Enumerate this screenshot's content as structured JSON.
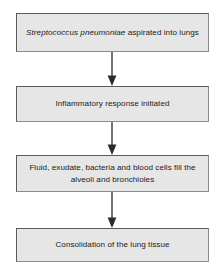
{
  "diagram": {
    "background_color": "#ffffff",
    "box_fill_color": "#e6e6e6",
    "box_border_color": "#5a5a5a",
    "arrow_color": "#2b2b2b",
    "orientation": "vertical top-to-bottom",
    "nodes": [
      {
        "id": "node-1",
        "organism_italic": "Streptococcus pneumoniae",
        "text_rest": " aspirated into lungs",
        "full_text": "Streptococcus pneumoniae aspirated into lungs"
      },
      {
        "id": "node-2",
        "full_text": "Inflammatory response initiated"
      },
      {
        "id": "node-3",
        "full_text": "Fluid, exudate, bacteria and blood cells fill the alveoli and bronchioles"
      },
      {
        "id": "node-4",
        "full_text": "Consolidation of the lung tissue"
      }
    ],
    "connectors": [
      {
        "id": "arrow-1",
        "from": "node-1",
        "to": "node-2",
        "shape": "down-arrow"
      },
      {
        "id": "arrow-2",
        "from": "node-2",
        "to": "node-3",
        "shape": "down-arrow"
      },
      {
        "id": "arrow-3",
        "from": "node-3",
        "to": "node-4",
        "shape": "down-arrow"
      }
    ]
  }
}
